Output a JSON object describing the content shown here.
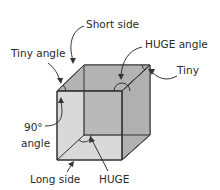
{
  "diagram": {
    "shape": "cube",
    "colors": {
      "face": "#b8b8b8",
      "edge": "#333333",
      "text": "#2a2a2a"
    },
    "labels": {
      "short_side": "Short side",
      "tiny_angle": "Tiny angle",
      "huge_angle": "HUGE angle",
      "tiny": "Tiny",
      "right_angle_line1": "90°",
      "right_angle_line2": "angle",
      "long_side": "Long side",
      "huge": "HUGE"
    }
  }
}
